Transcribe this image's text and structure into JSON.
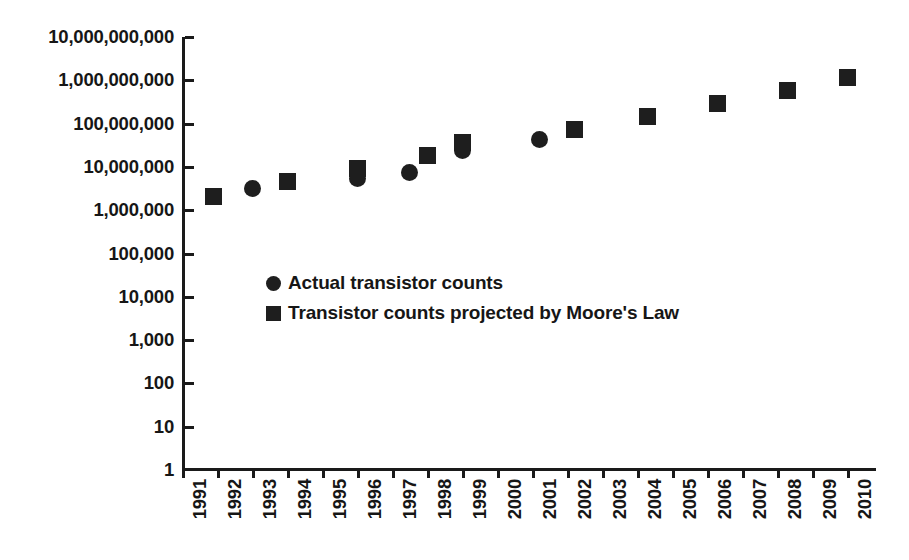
{
  "chart_data": {
    "type": "scatter",
    "title": "",
    "subtitle": "",
    "xlabel": "",
    "ylabel": "",
    "grid": false,
    "yscale": "log",
    "xlim": [
      1991,
      2010
    ],
    "ylim": [
      1,
      10000000000
    ],
    "y_ticks": [
      "10,000,000,000",
      "1,000,000,000",
      "100,000,000",
      "10,000,000",
      "1,000,000",
      "100,000",
      "10,000",
      "1,000",
      "100",
      "10",
      "1"
    ],
    "y_tick_values": [
      10000000000,
      1000000000,
      100000000,
      10000000,
      1000000,
      100000,
      10000,
      1000,
      100,
      10,
      1
    ],
    "x_ticks": [
      "1991",
      "1992",
      "1993",
      "1994",
      "1995",
      "1996",
      "1997",
      "1998",
      "1999",
      "2000",
      "2001",
      "2002",
      "2003",
      "2004",
      "2005",
      "2006",
      "2007",
      "2008",
      "2009",
      "2010"
    ],
    "legend_position": "inside-left",
    "series": [
      {
        "name": "Actual transistor counts",
        "marker": "circle",
        "color": "#1e1e1e",
        "points": [
          {
            "x": 1993.0,
            "y": 3100000
          },
          {
            "x": 1996.0,
            "y": 5500000
          },
          {
            "x": 1997.5,
            "y": 7500000
          },
          {
            "x": 1999.0,
            "y": 24000000
          },
          {
            "x": 2001.2,
            "y": 42000000
          }
        ]
      },
      {
        "name": "Transistor counts projected by Moore's Law",
        "marker": "square",
        "color": "#1e1e1e",
        "points": [
          {
            "x": 1991.9,
            "y": 2100000
          },
          {
            "x": 1994.0,
            "y": 4500000
          },
          {
            "x": 1996.0,
            "y": 9000000
          },
          {
            "x": 1998.0,
            "y": 18000000
          },
          {
            "x": 1999.0,
            "y": 36000000
          },
          {
            "x": 2002.2,
            "y": 72000000
          },
          {
            "x": 2004.3,
            "y": 145000000
          },
          {
            "x": 2006.3,
            "y": 290000000
          },
          {
            "x": 2008.3,
            "y": 580000000
          },
          {
            "x": 2010.0,
            "y": 1160000000
          }
        ]
      }
    ],
    "legend": [
      {
        "label": "Actual transistor counts",
        "marker": "circle"
      },
      {
        "label": "Transistor counts projected by Moore's Law",
        "marker": "square"
      }
    ]
  }
}
